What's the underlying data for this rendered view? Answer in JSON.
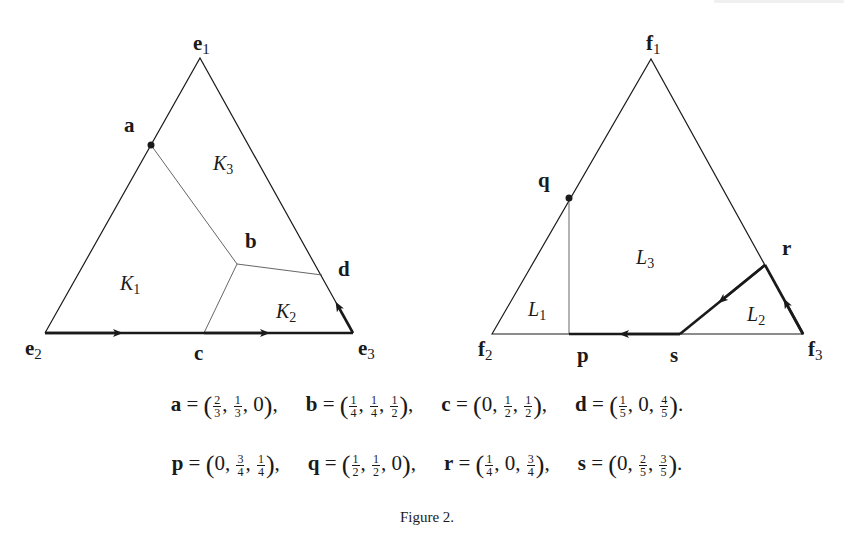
{
  "figure": {
    "caption": "Figure 2.",
    "left_triangle": {
      "vertices": {
        "e1": {
          "label": "e",
          "sub": "1"
        },
        "e2": {
          "label": "e",
          "sub": "2"
        },
        "e3": {
          "label": "e",
          "sub": "3"
        }
      },
      "points": {
        "a": "a",
        "b": "b",
        "c": "c",
        "d": "d"
      },
      "regions": [
        {
          "label": "K",
          "sub": "1"
        },
        {
          "label": "K",
          "sub": "2"
        },
        {
          "label": "K",
          "sub": "3"
        }
      ]
    },
    "right_triangle": {
      "vertices": {
        "f1": {
          "label": "f",
          "sub": "1"
        },
        "f2": {
          "label": "f",
          "sub": "2"
        },
        "f3": {
          "label": "f",
          "sub": "3"
        }
      },
      "points": {
        "p": "p",
        "q": "q",
        "r": "r",
        "s": "s"
      },
      "regions": [
        {
          "label": "L",
          "sub": "1"
        },
        {
          "label": "L",
          "sub": "2"
        },
        {
          "label": "L",
          "sub": "3"
        }
      ]
    },
    "equations_row1": [
      {
        "name": "a",
        "coords": [
          {
            "n": "2",
            "d": "3"
          },
          {
            "n": "1",
            "d": "3"
          },
          {
            "v": "0"
          }
        ],
        "end": ","
      },
      {
        "name": "b",
        "coords": [
          {
            "n": "1",
            "d": "4"
          },
          {
            "n": "1",
            "d": "4"
          },
          {
            "n": "1",
            "d": "2"
          }
        ],
        "end": ","
      },
      {
        "name": "c",
        "coords": [
          {
            "v": "0"
          },
          {
            "n": "1",
            "d": "2"
          },
          {
            "n": "1",
            "d": "2"
          }
        ],
        "end": ","
      },
      {
        "name": "d",
        "coords": [
          {
            "n": "1",
            "d": "5"
          },
          {
            "v": "0"
          },
          {
            "n": "4",
            "d": "5"
          }
        ],
        "end": "."
      }
    ],
    "equations_row2": [
      {
        "name": "p",
        "coords": [
          {
            "v": "0"
          },
          {
            "n": "3",
            "d": "4"
          },
          {
            "n": "1",
            "d": "4"
          }
        ],
        "end": ","
      },
      {
        "name": "q",
        "coords": [
          {
            "n": "1",
            "d": "2"
          },
          {
            "n": "1",
            "d": "2"
          },
          {
            "v": "0"
          }
        ],
        "end": ","
      },
      {
        "name": "r",
        "coords": [
          {
            "n": "1",
            "d": "4"
          },
          {
            "v": "0"
          },
          {
            "n": "3",
            "d": "4"
          }
        ],
        "end": ","
      },
      {
        "name": "s",
        "coords": [
          {
            "v": "0"
          },
          {
            "n": "2",
            "d": "5"
          },
          {
            "n": "3",
            "d": "5"
          }
        ],
        "end": "."
      }
    ],
    "colors": {
      "ink": "#1a1a1a",
      "thin_line": "#555555",
      "background": "#ffffff"
    }
  }
}
